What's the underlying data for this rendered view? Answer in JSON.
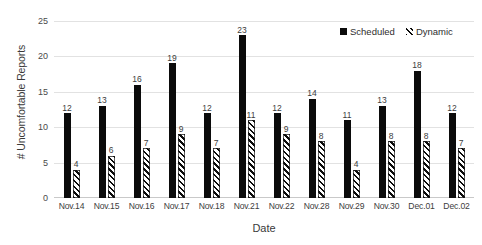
{
  "chart_data": {
    "type": "bar",
    "title": "",
    "xlabel": "Date",
    "ylabel": "# Uncomfortable Reports",
    "ylim": [
      0,
      25
    ],
    "yticks": [
      0,
      5,
      10,
      15,
      20,
      25
    ],
    "grid": true,
    "legend_position": "top-right",
    "categories": [
      "Nov.14",
      "Nov.15",
      "Nov.16",
      "Nov.17",
      "Nov.18",
      "Nov.21",
      "Nov.22",
      "Nov.28",
      "Nov.29",
      "Nov.30",
      "Dec.01",
      "Dec.02"
    ],
    "series": [
      {
        "name": "Scheduled",
        "style": "solid-black",
        "color": "#0b0b0b",
        "values": [
          12,
          13,
          16,
          19,
          12,
          23,
          12,
          14,
          11,
          13,
          18,
          12
        ]
      },
      {
        "name": "Dynamic",
        "style": "diagonal-hatch",
        "color": "#0b0b0b",
        "values": [
          4,
          6,
          7,
          9,
          7,
          11,
          9,
          8,
          4,
          8,
          8,
          7
        ]
      }
    ]
  },
  "legend": {
    "items": [
      {
        "label": "Scheduled",
        "swatch": "solid-square-icon"
      },
      {
        "label": "Dynamic",
        "swatch": "hatched-square-icon"
      }
    ]
  }
}
